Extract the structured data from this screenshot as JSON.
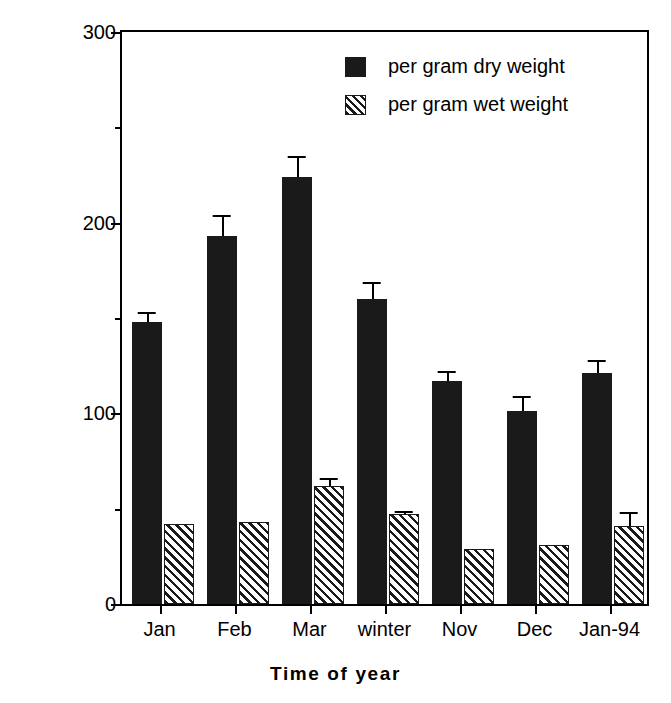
{
  "chart_data": {
    "type": "bar",
    "title": "",
    "xlabel": "Time of year",
    "ylabel": "Absorbance units per gram of tissue",
    "categories": [
      "Jan",
      "Feb",
      "Mar",
      "winter",
      "Nov",
      "Dec",
      "Jan-94"
    ],
    "ylim": [
      0,
      300
    ],
    "yticks": [
      0,
      100,
      200,
      300
    ],
    "ytick_labels": [
      "0",
      "100",
      "200",
      "300"
    ],
    "yminor_ticks": [
      50,
      150,
      250
    ],
    "grid": false,
    "legend_position": "upper right",
    "series": [
      {
        "name": "per gram dry weight",
        "color": "#1a1a1a",
        "fill": "solid",
        "values": [
          148,
          193,
          224,
          160,
          117,
          101,
          121
        ],
        "errors": [
          5,
          11,
          11,
          9,
          5,
          8,
          7
        ]
      },
      {
        "name": "per gram wet weight",
        "color": "#1a1a1a",
        "fill": "hatched",
        "values": [
          42,
          43,
          62,
          47,
          29,
          31,
          41
        ],
        "errors": [
          0,
          0,
          4,
          2,
          0,
          0,
          7
        ]
      }
    ]
  },
  "axes": {
    "y_title": "Absorbance units per gram of tissue",
    "x_title": "Time of year"
  },
  "legend": {
    "items": [
      {
        "label": "per gram dry weight",
        "swatch": "solid-black-square"
      },
      {
        "label": "per gram wet weight",
        "swatch": "hatched-square"
      }
    ]
  }
}
